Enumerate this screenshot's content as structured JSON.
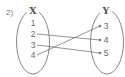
{
  "problem_label": "2)",
  "domain_set": {
    "name": "X",
    "elements": [
      "1",
      "2",
      "3",
      "4"
    ]
  },
  "codomain_set": {
    "name": "Y",
    "elements": [
      "3",
      "4",
      "5"
    ]
  },
  "mappings": [
    {
      "from": "2",
      "to": "4"
    },
    {
      "from": "3",
      "to": "5"
    },
    {
      "from": "4",
      "to": "3"
    }
  ],
  "colors": {
    "stroke": "#666666",
    "text": "#555555"
  }
}
